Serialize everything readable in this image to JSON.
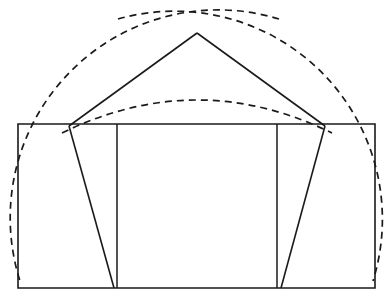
{
  "figure": {
    "canvas": {
      "width": 392,
      "height": 304,
      "background": "#ffffff"
    },
    "stroke_color": "#1a1a1a",
    "line_styles": {
      "solid": "solid",
      "construction": "dashed"
    }
  },
  "chart_data": {
    "type": "diagram",
    "title": "",
    "xlabel": "",
    "ylabel": "",
    "grid": false,
    "legend": "none",
    "xlim": [
      0,
      392
    ],
    "ylim": [
      0,
      304
    ],
    "points": {
      "rect_top_left": [
        18,
        124
      ],
      "rect_top_right": [
        375,
        124
      ],
      "rect_bottom_right": [
        375,
        288
      ],
      "rect_bottom_left": [
        18,
        288
      ],
      "apex": [
        197,
        33
      ],
      "left_vertex": [
        69,
        126
      ],
      "right_vertex": [
        325,
        126
      ],
      "left_foot": [
        114,
        288
      ],
      "right_foot": [
        281,
        288
      ],
      "inner_vertical_left_x": 117,
      "inner_vertical_right_x": 277,
      "arc_small_peak": [
        197,
        100
      ],
      "arc_left_end_top": [
        118,
        19
      ],
      "arc_right_end_top": [
        279,
        19
      ],
      "arc_left_end_bottom": [
        20,
        281
      ],
      "arc_right_end_bottom": [
        373,
        281
      ]
    },
    "shapes": [
      {
        "name": "outer-rectangle",
        "kind": "rect",
        "style": "solid",
        "x": 18,
        "y": 124,
        "w": 357,
        "h": 164
      },
      {
        "name": "inner-vertical-left",
        "kind": "line",
        "style": "solid",
        "from": [
          117,
          124
        ],
        "to": [
          117,
          288
        ]
      },
      {
        "name": "inner-vertical-right",
        "kind": "line",
        "style": "solid",
        "from": [
          277,
          124
        ],
        "to": [
          277,
          288
        ]
      },
      {
        "name": "apex-to-left-vertex",
        "kind": "line",
        "style": "solid",
        "from": [
          197,
          33
        ],
        "to": [
          69,
          126
        ]
      },
      {
        "name": "apex-to-right-vertex",
        "kind": "line",
        "style": "solid",
        "from": [
          197,
          33
        ],
        "to": [
          325,
          126
        ]
      },
      {
        "name": "left-vertex-to-base",
        "kind": "line",
        "style": "solid",
        "from": [
          69,
          126
        ],
        "to": [
          114,
          288
        ]
      },
      {
        "name": "right-vertex-to-base",
        "kind": "line",
        "style": "solid",
        "from": [
          325,
          126
        ],
        "to": [
          281,
          288
        ]
      },
      {
        "name": "arc-large-left-center",
        "kind": "arc",
        "style": "dashed",
        "center": [
          69,
          126
        ],
        "radius": 208,
        "from": [
          279,
          19
        ],
        "to": [
          20,
          281
        ]
      },
      {
        "name": "arc-large-right-center",
        "kind": "arc",
        "style": "dashed",
        "center": [
          325,
          126
        ],
        "radius": 208,
        "from": [
          118,
          19
        ],
        "to": [
          373,
          281
        ]
      },
      {
        "name": "arc-small-span",
        "kind": "arc",
        "style": "dashed",
        "from": [
          62,
          133
        ],
        "to": [
          332,
          133
        ],
        "peak": [
          197,
          100
        ]
      }
    ],
    "counts": {
      "solid_segments": 7,
      "dashed_arcs": 3,
      "vertices": 5
    }
  }
}
